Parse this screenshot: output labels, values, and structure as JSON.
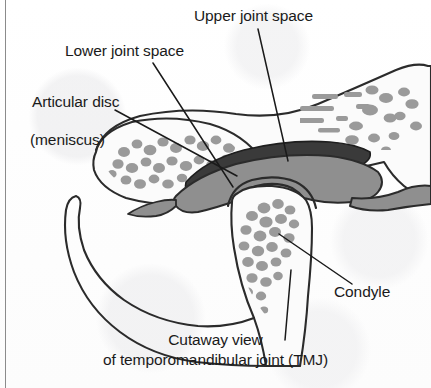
{
  "figure": {
    "kind": "anatomical-illustration",
    "caption_line1": "Cutaway view",
    "caption_line2": "of temporomandibular joint (TMJ)"
  },
  "labels": {
    "upper_joint_space": "Upper joint space",
    "lower_joint_space": "Lower joint space",
    "articular_disc_line1": "Articular disc",
    "articular_disc_line2": "(meniscus)",
    "condyle": "Condyle"
  },
  "colors": {
    "ink": "#1a1a1a",
    "outline": "#2b2b2b",
    "upper_joint_space_band": "#3a3a3a",
    "articular_disc_gray": "#8f8f8f",
    "trabecular_bone_gray": "#9a9a9a",
    "bone_fill": "#fbfbfb",
    "page_background": "#fdfdfd",
    "page_rule": "#8b8b8b"
  },
  "structures": [
    {
      "name": "temporal-bone",
      "label": "Temporal bone (cranial base)",
      "description": "Upper bone forming the roof of the joint, with horizontal streak-like trabeculae and the articular eminence sloping down to the left."
    },
    {
      "name": "articular-eminence",
      "label": "Articular eminence",
      "description": "Left-hand bony prominence of the temporal bone with stippled trabecular bone."
    },
    {
      "name": "upper-joint-space",
      "label": "Upper joint space",
      "description": "Dark crescent-shaped cavity between the temporal bone above and the articular disc below."
    },
    {
      "name": "articular-disc",
      "label": "Articular disc (meniscus)",
      "description": "Mid-gray fibrocartilage band lying between the temporal bone and the mandibular condyle."
    },
    {
      "name": "lower-joint-space",
      "label": "Lower joint space",
      "description": "Narrow cavity between the underside of the articular disc and the head of the condyle."
    },
    {
      "name": "condyle",
      "label": "Condyle",
      "description": "Rounded head of the mandible, filled with stippled trabecular bone, continuing downward into the mandibular ramus and neck."
    },
    {
      "name": "mandibular-ramus",
      "label": "Mandibular ramus",
      "description": "Curved outline sweeping down and to the left below the condyle."
    }
  ],
  "leader_lines": [
    {
      "name": "leader-upper-joint-space",
      "from": [
        258,
        29
      ],
      "to": [
        288,
        161
      ]
    },
    {
      "name": "leader-lower-joint-space",
      "from": [
        153,
        63
      ],
      "to": [
        233,
        187
      ]
    },
    {
      "name": "leader-articular-disc",
      "from": [
        115,
        110
      ],
      "to": [
        237,
        176
      ]
    },
    {
      "name": "leader-condyle",
      "from": [
        352,
        284
      ],
      "to": [
        279,
        234
      ]
    },
    {
      "name": "leader-caption",
      "from": [
        285,
        340
      ],
      "to": [
        290,
        270
      ]
    }
  ]
}
